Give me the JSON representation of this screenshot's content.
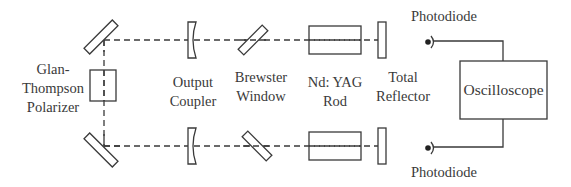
{
  "diagram": {
    "title": "",
    "type": "optical-setup",
    "colors": {
      "line": "#3a3a3a",
      "background": "#ffffff"
    },
    "components": {
      "polarizer": {
        "line1": "Glan-",
        "line2": "Thompson",
        "line3": "Polarizer"
      },
      "output_coupler": {
        "line1": "Output",
        "line2": "Coupler"
      },
      "brewster_window": {
        "line1": "Brewster",
        "line2": "Window"
      },
      "yag_rod": {
        "line1": "Nd: YAG",
        "line2": "Rod"
      },
      "total_reflector": {
        "line1": "Total",
        "line2": "Reflector"
      },
      "photodiode_top": {
        "label": "Photodiode"
      },
      "photodiode_bottom": {
        "label": "Photodiode"
      },
      "oscilloscope": {
        "label": "Oscilloscope"
      }
    },
    "beams": [
      {
        "name": "upper-beam",
        "style": "dashed"
      },
      {
        "name": "lower-beam",
        "style": "dashed"
      },
      {
        "name": "vertical-beam",
        "style": "dashed"
      }
    ]
  }
}
